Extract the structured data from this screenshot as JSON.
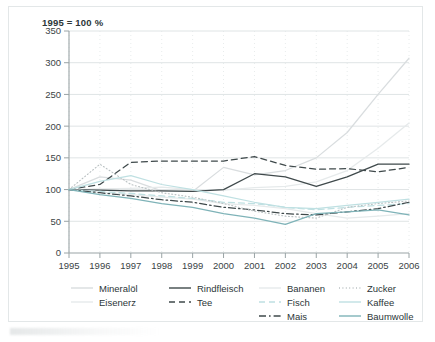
{
  "caption": "1995 = 100 %",
  "axis": {
    "y_ticks": [
      "0",
      "50",
      "100",
      "150",
      "200",
      "250",
      "300",
      "350"
    ],
    "x_ticks": [
      "1995",
      "1996",
      "1997",
      "1998",
      "1999",
      "2000",
      "2001",
      "2002",
      "2003",
      "2004",
      "2005",
      "2006"
    ]
  },
  "legend": {
    "columns": [
      {
        "items": [
          {
            "label": "Mineralöl",
            "key": "mineraloel"
          },
          {
            "label": "Eisenerz",
            "key": "eisenerz"
          }
        ]
      },
      {
        "items": [
          {
            "label": "Rindfleisch",
            "key": "rindfleisch"
          },
          {
            "label": "Tee",
            "key": "tee"
          }
        ]
      },
      {
        "items": [
          {
            "label": "Bananen",
            "key": "bananen"
          },
          {
            "label": "Fisch",
            "key": "fisch"
          },
          {
            "label": "Mais",
            "key": "mais"
          }
        ]
      },
      {
        "items": [
          {
            "label": "Zucker",
            "key": "zucker"
          },
          {
            "label": "Kaffee",
            "key": "kaffee"
          },
          {
            "label": "Baumwolle",
            "key": "baumwolle"
          }
        ]
      }
    ]
  },
  "colors": {
    "light_gray": "#d9dddf",
    "pale_gray": "#e6eaeb",
    "dark_gray": "#3f494b",
    "teal": "#7fb3b8",
    "pale_teal": "#bfe0e2",
    "axis": "#9aa4a6",
    "grid": "#dfe4e5",
    "grid_v": "#e8ecec",
    "frame": "#e3e7e8"
  },
  "chart_data": {
    "type": "line",
    "title": "1995 = 100 %",
    "xlabel": "",
    "ylabel": "",
    "xlim": [
      1995,
      2006
    ],
    "ylim": [
      0,
      350
    ],
    "ytick_step": 50,
    "grid": true,
    "legend_position": "bottom",
    "x": [
      1995,
      1996,
      1997,
      1998,
      1999,
      2000,
      2001,
      2002,
      2003,
      2004,
      2005,
      2006
    ],
    "series": [
      {
        "name": "Mineralöl",
        "color": "#d9dddf",
        "style": "solid",
        "values": [
          100,
          120,
          115,
          98,
          97,
          135,
          123,
          130,
          150,
          190,
          250,
          307
        ]
      },
      {
        "name": "Eisenerz",
        "color": "#e6eaeb",
        "style": "solid",
        "values": [
          100,
          101,
          102,
          104,
          100,
          99,
          103,
          105,
          112,
          130,
          165,
          205
        ]
      },
      {
        "name": "Rindfleisch",
        "color": "#3f494b",
        "style": "solid",
        "values": [
          100,
          99,
          98,
          98,
          97,
          100,
          125,
          120,
          105,
          120,
          140,
          140
        ]
      },
      {
        "name": "Tee",
        "color": "#3f494b",
        "style": "dashed",
        "values": [
          100,
          108,
          143,
          145,
          145,
          145,
          152,
          138,
          132,
          133,
          128,
          135
        ]
      },
      {
        "name": "Bananen",
        "color": "#e6eaeb",
        "style": "solid",
        "values": [
          100,
          96,
          92,
          88,
          85,
          78,
          75,
          70,
          62,
          55,
          58,
          62
        ]
      },
      {
        "name": "Fisch",
        "color": "#bfe0e2",
        "style": "dashed",
        "values": [
          100,
          97,
          94,
          90,
          86,
          80,
          78,
          72,
          68,
          72,
          75,
          78
        ]
      },
      {
        "name": "Mais",
        "color": "#3f494b",
        "style": "dashdot",
        "values": [
          100,
          95,
          90,
          84,
          80,
          72,
          68,
          62,
          60,
          65,
          70,
          80
        ]
      },
      {
        "name": "Zucker",
        "color": "#b9c0c2",
        "style": "dotted",
        "values": [
          100,
          140,
          108,
          95,
          88,
          78,
          66,
          58,
          55,
          72,
          78,
          82
        ]
      },
      {
        "name": "Kaffee",
        "color": "#bfe0e2",
        "style": "solid",
        "values": [
          100,
          113,
          122,
          108,
          100,
          90,
          80,
          72,
          70,
          75,
          80,
          85
        ]
      },
      {
        "name": "Baumwolle",
        "color": "#7fb3b8",
        "style": "solid",
        "values": [
          100,
          92,
          86,
          78,
          72,
          62,
          55,
          45,
          62,
          65,
          68,
          60
        ]
      }
    ]
  }
}
